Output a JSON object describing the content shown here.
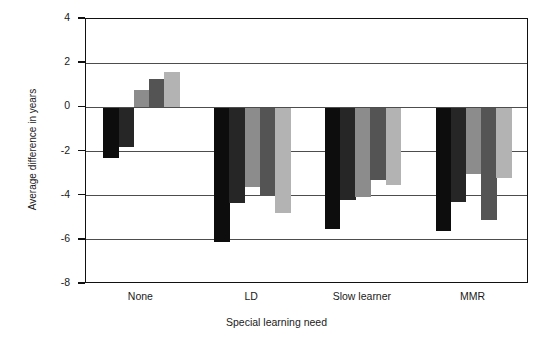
{
  "chart_data": {
    "type": "bar",
    "title": "",
    "xlabel": "Special learning need",
    "ylabel": "Average difference in years",
    "categories": [
      "None",
      "LD",
      "Slow learner",
      "MMR"
    ],
    "ylim": [
      -8,
      4
    ],
    "yticks": [
      4,
      2,
      0,
      -2,
      -4,
      -6,
      -8
    ],
    "ytick_labels": [
      "4",
      "2",
      "0",
      "-2",
      "-4",
      "-6",
      "-8"
    ],
    "grid": true,
    "gridlines": [
      2,
      0,
      -2,
      -4,
      -6
    ],
    "legend": "none",
    "series": [
      {
        "name": "series-1",
        "color": "#0d0d0d",
        "values": [
          -2.3,
          -6.1,
          -5.5,
          -5.6
        ]
      },
      {
        "name": "series-2",
        "color": "#262626",
        "values": [
          -1.8,
          -4.35,
          -4.2,
          -4.3
        ]
      },
      {
        "name": "series-3",
        "color": "#8c8c8c",
        "values": [
          0.8,
          -3.6,
          -4.05,
          -3.0
        ]
      },
      {
        "name": "series-4",
        "color": "#545454",
        "values": [
          1.3,
          -4.0,
          -3.3,
          -5.1
        ]
      },
      {
        "name": "series-5",
        "color": "#b3b3b3",
        "values": [
          1.6,
          -4.8,
          -3.5,
          -3.2
        ]
      }
    ]
  }
}
